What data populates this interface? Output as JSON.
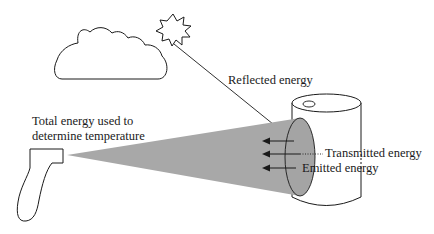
{
  "diagram": {
    "labels": {
      "total_energy_line1": "Total energy used to",
      "total_energy_line2": "determine temperature",
      "reflected": "Reflected energy",
      "transmitted": "Transmitted energy",
      "emitted": "Emitted energy"
    },
    "elements": [
      "cloud",
      "sun",
      "infrared-thermometer",
      "measurement-beam",
      "cylinder-target",
      "target-spot"
    ],
    "colors": {
      "stroke": "#1a1a1a",
      "beam": "#a8a8a8",
      "spot": "#a4a4a4",
      "background": "#ffffff"
    }
  }
}
